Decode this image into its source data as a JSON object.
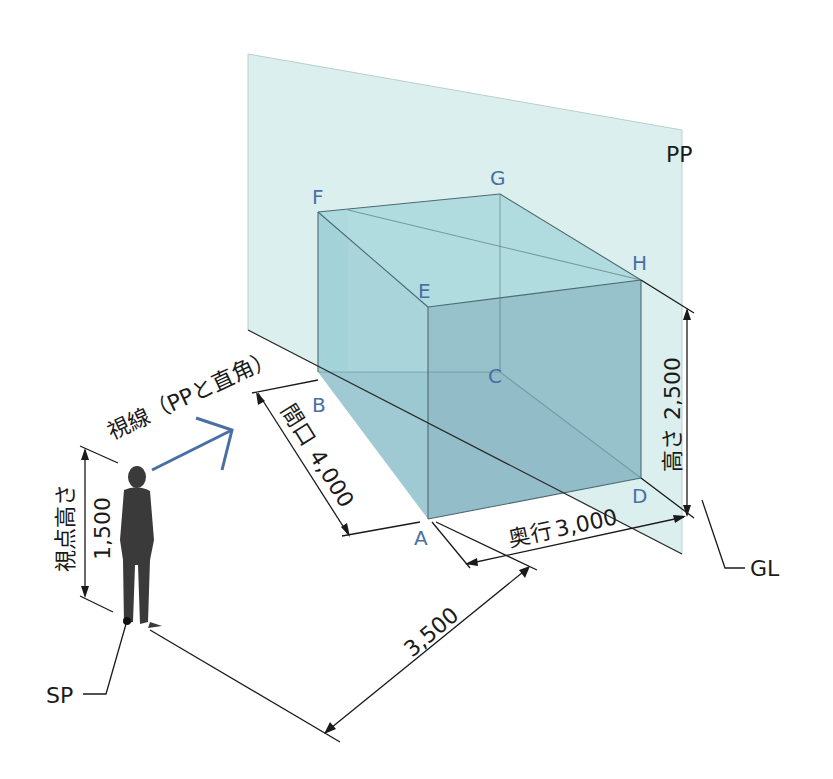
{
  "diagram": {
    "plane_label": "PP",
    "ground_line_label": "GL",
    "station_point_label": "SP",
    "vertices": {
      "A": "A",
      "B": "B",
      "C": "C",
      "D": "D",
      "E": "E",
      "F": "F",
      "G": "G",
      "H": "H"
    },
    "sight_line_label": "視線（PPと直角）",
    "dimensions": {
      "width": {
        "label": "間口",
        "value": "4,000"
      },
      "depth": {
        "label": "奥行",
        "value": "3,000"
      },
      "height": {
        "label": "高さ",
        "value": "2,500"
      },
      "eye_height": {
        "label": "視点高さ",
        "value": "1,500"
      },
      "distance": {
        "label": "",
        "value": "3,500"
      }
    },
    "colors": {
      "picture_plane": "#d7efed",
      "box_fill": "#9fcfd6",
      "box_front": "#8fbcc6",
      "vertex_label": "#4a6fa5",
      "sight_arrow": "#4a6fa5",
      "person": "#3a3a3a"
    }
  }
}
